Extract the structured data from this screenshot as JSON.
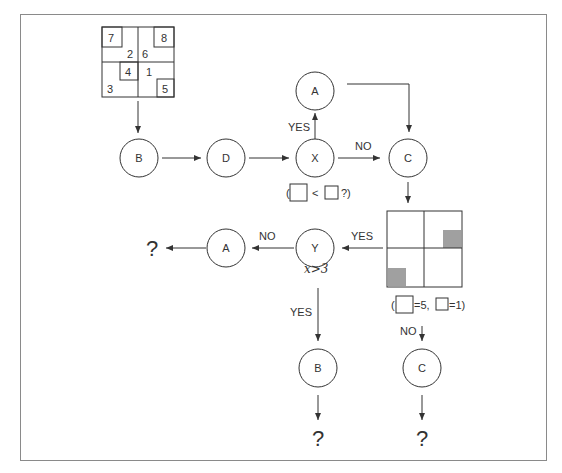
{
  "puzzle_grid": {
    "numbers": [
      "7",
      "8",
      "2",
      "6",
      "4",
      "1",
      "3",
      "5"
    ]
  },
  "nodes": {
    "b_top": "B",
    "d": "D",
    "x": "X",
    "a_top": "A",
    "c_top": "C",
    "y": "Y",
    "a_left": "A",
    "b_bottom": "B",
    "c_bottom": "C"
  },
  "labels": {
    "yes_x_to_a": "YES",
    "no_x_to_c": "NO",
    "yes_grid_to_y": "YES",
    "no_y_to_a": "NO",
    "yes_y_to_b": "YES",
    "no_grid_to_c": "NO"
  },
  "conditions": {
    "x_cond_open": "(",
    "x_cond_op": "<",
    "x_cond_close": "?)",
    "y_cond": "x>3",
    "grid_cond_open": "(",
    "grid_cond_big_eq": "=5,",
    "grid_cond_small_eq": "=1)"
  },
  "outputs": {
    "left": "?",
    "bottom_b": "?",
    "bottom_c": "?"
  },
  "colors": {
    "line": "#333333",
    "frame": "#8a8a8a",
    "shade": "#a0a0a0"
  }
}
